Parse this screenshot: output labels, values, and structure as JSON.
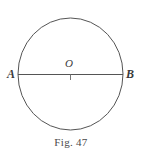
{
  "figure": {
    "caption": "Fig. 47",
    "background_color": "#ffffff",
    "stroke_color": "#555555",
    "label_color": "#3b3b3b",
    "width": 142,
    "height": 153
  },
  "geometry": {
    "shape_name": "circle-with-diameter",
    "circle": {
      "center_x": 70.5,
      "center_y": 74,
      "radius_x": 52.5,
      "radius_y": 56,
      "stroke_width": 1
    },
    "diameter": {
      "from_x": 18,
      "from_y": 74.5,
      "to_x": 123,
      "to_y": 74.5,
      "stroke_width": 1
    },
    "center_tick": {
      "x": 70.5,
      "y_top": 74.5,
      "y_bottom": 80,
      "stroke_width": 1
    }
  },
  "labels": {
    "point_a": "A",
    "point_o": "O",
    "point_b": "B"
  }
}
